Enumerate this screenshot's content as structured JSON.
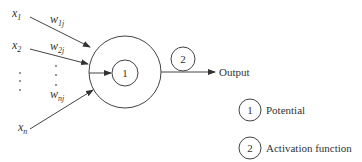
{
  "diagram": {
    "type": "artificial-neuron",
    "inputs": [
      {
        "label": "x",
        "sub": "1",
        "weight": "w",
        "weight_sub": "1j"
      },
      {
        "label": "x",
        "sub": "2",
        "weight": "w",
        "weight_sub": "2j"
      },
      {
        "label": "x",
        "sub": "n",
        "weight": "w",
        "weight_sub": "nj"
      }
    ],
    "neuron": {
      "inner_label": "1"
    },
    "output": {
      "circle_label": "2",
      "label": "Output"
    },
    "legend": [
      {
        "marker": "1",
        "text": "Potential"
      },
      {
        "marker": "2",
        "text": "Activation function"
      }
    ],
    "colors": {
      "line": "#444444",
      "text": "#333333",
      "background": "#ffffff"
    }
  }
}
